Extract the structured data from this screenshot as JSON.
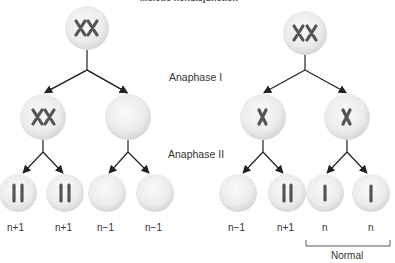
{
  "title": "Meiotic nondisjunction",
  "stages": {
    "anaphase1": "Anaphase I",
    "anaphase2": "Anaphase II"
  },
  "bottom_labels": [
    "n+1",
    "n+1",
    "n−1",
    "n−1",
    "n−1",
    "n+1",
    "n",
    "n"
  ],
  "bracket_label": "Normal",
  "colors": {
    "cell_fill": "#e8e8e8",
    "cell_edge": "#cfcfcf",
    "chromosome": "#555555",
    "arrow": "#222222"
  }
}
